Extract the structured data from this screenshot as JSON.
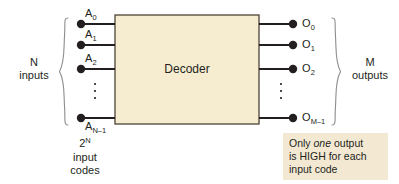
{
  "figure": {
    "block": {
      "label": "Decoder",
      "fill_color": "#f6edd1",
      "border_color": "#4d4236"
    },
    "inputs": {
      "group_caption_line1": "N",
      "group_caption_line2": "inputs",
      "ports": [
        {
          "name": "A",
          "sub": "0"
        },
        {
          "name": "A",
          "sub": "1"
        },
        {
          "name": "A",
          "sub": "2"
        },
        {
          "name": "A",
          "sub": "N–1"
        }
      ],
      "ellipsis": "⋮",
      "codes_caption": {
        "base": "2",
        "exponent": "N",
        "line2": "input",
        "line3": "codes"
      }
    },
    "outputs": {
      "group_caption_line1": "M",
      "group_caption_line2": "outputs",
      "ports": [
        {
          "name": "O",
          "sub": "0"
        },
        {
          "name": "O",
          "sub": "1"
        },
        {
          "name": "O",
          "sub": "2"
        },
        {
          "name": "O",
          "sub": "M–1"
        }
      ],
      "ellipsis": "⋮"
    },
    "note": {
      "line1_pre": "Only ",
      "line1_em": "one",
      "line1_post": " output",
      "line2": "is HIGH for each",
      "line3": "input code",
      "fill_color": "#f3e9d3"
    },
    "colors": {
      "line": "#231f20",
      "brace": "#8c8c8c",
      "background": "#ffffff"
    }
  }
}
